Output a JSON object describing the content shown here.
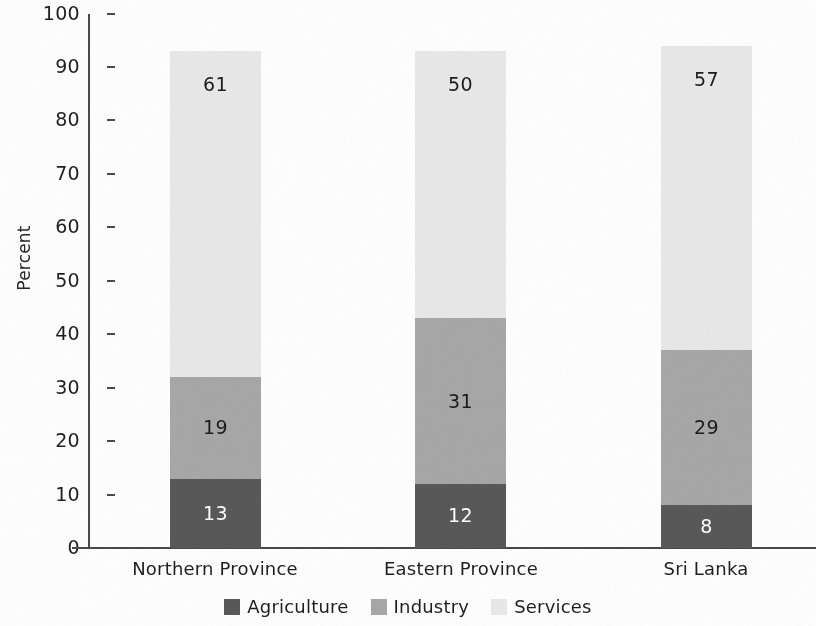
{
  "chart_data": {
    "type": "bar",
    "subtype": "stacked-100-percent",
    "title": "",
    "xlabel": "",
    "ylabel": "Percent",
    "ylim": [
      0,
      100
    ],
    "yticks": [
      0,
      10,
      20,
      30,
      40,
      50,
      60,
      70,
      80,
      90,
      100
    ],
    "ytick_labels": [
      "0",
      "10",
      "20",
      "30",
      "40",
      "50",
      "60",
      "70",
      "80",
      "90",
      "100"
    ],
    "grid": false,
    "legend_position": "bottom-center",
    "categories": [
      "Northern Province",
      "Eastern Province",
      "Sri Lanka"
    ],
    "series": [
      {
        "name": "Agriculture",
        "color": "#595959",
        "label_color": "#ffffff",
        "values": [
          13,
          12,
          8
        ],
        "value_labels": [
          "13",
          "12",
          "8"
        ]
      },
      {
        "name": "Industry",
        "color": "#a8a8a8",
        "label_color": "#1c1c1c",
        "values": [
          19,
          31,
          29
        ],
        "value_labels": [
          "19",
          "31",
          "29"
        ]
      },
      {
        "name": "Services",
        "color": "#e9e9e9",
        "label_color": "#1c1c1c",
        "values": [
          61,
          50,
          57
        ],
        "value_labels": [
          "61",
          "50",
          "57"
        ]
      }
    ]
  },
  "axis": {
    "y_title": "Percent",
    "ticks": {
      "t100": "100",
      "t90": "90",
      "t80": "80",
      "t70": "70",
      "t60": "60",
      "t50": "50",
      "t40": "40",
      "t30": "30",
      "t20": "20",
      "t10": "10",
      "t0": "0"
    }
  },
  "bars": [
    {
      "category": "Northern Province",
      "agriculture": "13",
      "industry": "19",
      "services": "61"
    },
    {
      "category": "Eastern Province",
      "agriculture": "12",
      "industry": "31",
      "services": "50"
    },
    {
      "category": "Sri Lanka",
      "agriculture": "8",
      "industry": "29",
      "services": "57"
    }
  ],
  "legend": {
    "items": [
      {
        "label": "Agriculture",
        "color": "#595959"
      },
      {
        "label": "Industry",
        "color": "#a8a8a8"
      },
      {
        "label": "Services",
        "color": "#e9e9e9"
      }
    ]
  },
  "colors": {
    "agriculture": "#595959",
    "industry": "#a8a8a8",
    "services": "#e9e9e9",
    "axis": "#4a4a4a",
    "text": "#1f1f1f",
    "background": "#ffffff"
  }
}
